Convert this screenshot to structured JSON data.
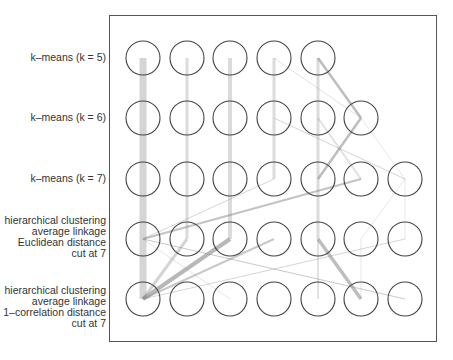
{
  "rows": [
    {
      "label_lines": [
        "k–means (k = 5)"
      ],
      "nodes": 5,
      "y": 58
    },
    {
      "label_lines": [
        "k–means (k = 6)"
      ],
      "nodes": 6,
      "y": 118
    },
    {
      "label_lines": [
        "k–means (k = 7)"
      ],
      "nodes": 7,
      "y": 179
    },
    {
      "label_lines": [
        "hierarchical clustering",
        "average linkage",
        "Euclidean distance",
        "cut at 7"
      ],
      "nodes": 7,
      "y": 239
    },
    {
      "label_lines": [
        "hierarchical clustering",
        "average linkage",
        "1–correlation distance",
        "cut at 7"
      ],
      "nodes": 7,
      "y": 299
    }
  ],
  "columns_x": [
    143,
    187,
    230,
    274,
    318,
    361,
    405
  ],
  "node_radius": 17,
  "colors": {
    "node_stroke": "#444444",
    "frame": "#555555",
    "flow": "#888888",
    "text": "#333333"
  },
  "flows": [
    {
      "from": [
        0,
        0
      ],
      "to": [
        1,
        0
      ],
      "w": 7,
      "o": 0.35
    },
    {
      "from": [
        0,
        1
      ],
      "to": [
        1,
        1
      ],
      "w": 3,
      "o": 0.3
    },
    {
      "from": [
        0,
        2
      ],
      "to": [
        1,
        2
      ],
      "w": 4,
      "o": 0.3
    },
    {
      "from": [
        0,
        3
      ],
      "to": [
        1,
        3
      ],
      "w": 3,
      "o": 0.3
    },
    {
      "from": [
        0,
        4
      ],
      "to": [
        1,
        4
      ],
      "w": 3,
      "o": 0.3
    },
    {
      "from": [
        0,
        4
      ],
      "to": [
        1,
        5
      ],
      "w": 2.5,
      "o": 0.55
    },
    {
      "from": [
        0,
        3
      ],
      "to": [
        1,
        5
      ],
      "w": 1,
      "o": 0.25
    },
    {
      "from": [
        1,
        0
      ],
      "to": [
        2,
        0
      ],
      "w": 7,
      "o": 0.35
    },
    {
      "from": [
        1,
        1
      ],
      "to": [
        2,
        1
      ],
      "w": 3,
      "o": 0.3
    },
    {
      "from": [
        1,
        2
      ],
      "to": [
        2,
        2
      ],
      "w": 4,
      "o": 0.3
    },
    {
      "from": [
        1,
        3
      ],
      "to": [
        2,
        3
      ],
      "w": 3,
      "o": 0.3
    },
    {
      "from": [
        1,
        3
      ],
      "to": [
        2,
        6
      ],
      "w": 1,
      "o": 0.35
    },
    {
      "from": [
        1,
        4
      ],
      "to": [
        2,
        4
      ],
      "w": 3,
      "o": 0.3
    },
    {
      "from": [
        1,
        4
      ],
      "to": [
        2,
        5
      ],
      "w": 2,
      "o": 0.25
    },
    {
      "from": [
        1,
        5
      ],
      "to": [
        2,
        4
      ],
      "w": 2.5,
      "o": 0.55
    },
    {
      "from": [
        1,
        5
      ],
      "to": [
        2,
        6
      ],
      "w": 1,
      "o": 0.2
    },
    {
      "from": [
        2,
        0
      ],
      "to": [
        3,
        0
      ],
      "w": 7,
      "o": 0.35
    },
    {
      "from": [
        2,
        1
      ],
      "to": [
        3,
        1
      ],
      "w": 3,
      "o": 0.3
    },
    {
      "from": [
        2,
        2
      ],
      "to": [
        3,
        2
      ],
      "w": 4,
      "o": 0.3
    },
    {
      "from": [
        2,
        3
      ],
      "to": [
        3,
        0
      ],
      "w": 1,
      "o": 0.35
    },
    {
      "from": [
        2,
        4
      ],
      "to": [
        3,
        4
      ],
      "w": 3,
      "o": 0.3
    },
    {
      "from": [
        2,
        5
      ],
      "to": [
        3,
        0
      ],
      "w": 2,
      "o": 0.5
    },
    {
      "from": [
        2,
        6
      ],
      "to": [
        3,
        5
      ],
      "w": 1,
      "o": 0.2
    },
    {
      "from": [
        2,
        6
      ],
      "to": [
        3,
        6
      ],
      "w": 1,
      "o": 0.2
    },
    {
      "from": [
        3,
        0
      ],
      "to": [
        4,
        0
      ],
      "w": 7,
      "o": 0.35
    },
    {
      "from": [
        3,
        0
      ],
      "to": [
        4,
        6
      ],
      "w": 1,
      "o": 0.45
    },
    {
      "from": [
        3,
        0
      ],
      "to": [
        4,
        2
      ],
      "w": 1.5,
      "o": 0.15
    },
    {
      "from": [
        3,
        1
      ],
      "to": [
        4,
        0
      ],
      "w": 3,
      "o": 0.35
    },
    {
      "from": [
        3,
        2
      ],
      "to": [
        4,
        0
      ],
      "w": 4,
      "o": 0.6
    },
    {
      "from": [
        3,
        3
      ],
      "to": [
        4,
        0
      ],
      "w": 2,
      "o": 0.45
    },
    {
      "from": [
        3,
        4
      ],
      "to": [
        4,
        4
      ],
      "w": 2,
      "o": 0.25
    },
    {
      "from": [
        3,
        4
      ],
      "to": [
        4,
        5
      ],
      "w": 3.5,
      "o": 0.55
    },
    {
      "from": [
        3,
        6
      ],
      "to": [
        4,
        0
      ],
      "w": 1,
      "o": 0.35
    },
    {
      "from": [
        3,
        5
      ],
      "to": [
        4,
        5
      ],
      "w": 1,
      "o": 0.2
    }
  ]
}
